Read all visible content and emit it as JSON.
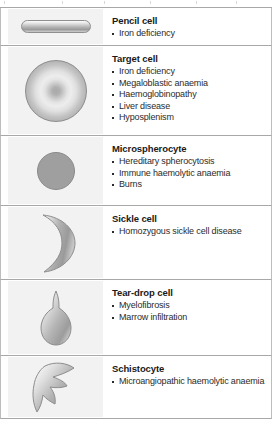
{
  "figure": {
    "kind": "red-cell-morphology-table",
    "panel_count": 6,
    "colors": {
      "panel_border": "#a8a8a8",
      "illustration_background": "#f2f2f2",
      "cell_grey": "#9f9f9f",
      "heading_text": "#1a1a1a",
      "body_text": "#2b2b2b"
    }
  },
  "panels": [
    {
      "name": "pencil-cell",
      "title": "Pencil cell",
      "shape": "elongated-capsule",
      "causes": [
        "Iron deficiency"
      ]
    },
    {
      "name": "target-cell",
      "title": "Target cell",
      "shape": "bullseye-circle",
      "causes": [
        "Iron deficiency",
        "Megaloblastic anaemia",
        "Haemoglobinopathy",
        "Liver disease",
        "Hyposplenism"
      ]
    },
    {
      "name": "microspherocyte",
      "title": "Microspherocyte",
      "shape": "small-dense-circle",
      "causes": [
        "Hereditary spherocytosis",
        "Immune haemolytic anaemia",
        "Burns"
      ]
    },
    {
      "name": "sickle-cell",
      "title": "Sickle cell",
      "shape": "crescent",
      "causes": [
        "Homozygous sickle cell disease"
      ]
    },
    {
      "name": "tear-drop-cell",
      "title": "Tear-drop cell",
      "shape": "teardrop",
      "causes": [
        "Myelofibrosis",
        "Marrow infiltration"
      ]
    },
    {
      "name": "schistocyte",
      "title": "Schistocyte",
      "shape": "angular-fragment",
      "causes": [
        "Microangiopathic haemolytic anaemia"
      ]
    }
  ]
}
